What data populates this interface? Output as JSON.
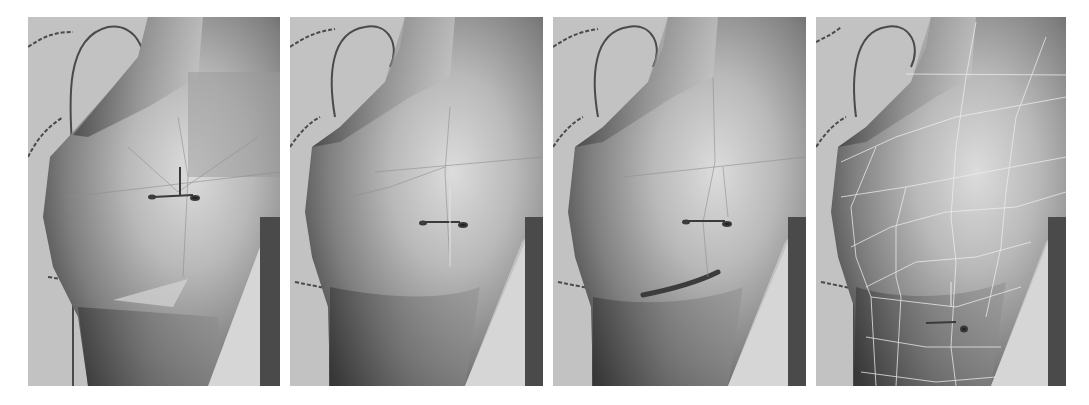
{
  "figure": {
    "panel_count": 4,
    "background": "#ffffff",
    "viewport_bg": "#c2c2c2",
    "panels": [
      {
        "id": 1,
        "x": 28,
        "width": 252,
        "stage": "low-poly base with faceted patch",
        "wireframe": "faint",
        "artifact": "light triangular facet below breast"
      },
      {
        "id": 2,
        "x": 290,
        "width": 253,
        "stage": "smoothed surface",
        "wireframe": "faint",
        "artifact": "none"
      },
      {
        "id": 3,
        "x": 553,
        "width": 253,
        "stage": "refined underside crease",
        "wireframe": "faint",
        "artifact": "dark crease under breast"
      },
      {
        "id": 4,
        "x": 816,
        "width": 250,
        "stage": "final mesh with visible wireframe",
        "wireframe": "visible-white",
        "artifact": "manipulator moved lower"
      }
    ],
    "elements": {
      "manipulator": "transform-gizmo-icon",
      "reference": "dashed-reference-curves",
      "side_bar": "dark-vertical-background-bar"
    }
  }
}
